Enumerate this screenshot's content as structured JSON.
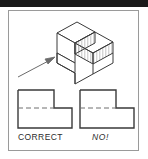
{
  "figure": {
    "title_band": "",
    "background_color": "#ffffff",
    "frame_color": "#9a9a9a",
    "line_color": "#3a3a3a",
    "hatch_color": "#8e8e8e",
    "dashed_color": "#6f6f6f",
    "text_color": "#2b2b2b"
  },
  "pictorial": {
    "name": "isometric-step-block",
    "description": "Isometric L-shaped step block with shaded vertical faces",
    "arrow": {
      "name": "pointer-arrow",
      "points_to": "front-left vertical face"
    },
    "shaded_faces": [
      "front-right-upper",
      "front-right-lower"
    ]
  },
  "views": [
    {
      "id": "correct",
      "caption": "CORRECT",
      "caption_style": "normal",
      "hidden_line": "partial",
      "hidden_line_note": "dashed line stops at the step corner"
    },
    {
      "id": "no",
      "caption": "NO!",
      "caption_style": "italic",
      "hidden_line": "full",
      "hidden_line_note": "dashed line runs full width"
    }
  ]
}
